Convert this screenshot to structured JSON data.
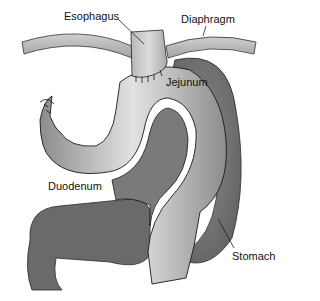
{
  "diagram": {
    "type": "anatomical-illustration",
    "labels": {
      "esophagus": "Esophagus",
      "diaphragm": "Diaphragm",
      "jejunum": "Jejunum",
      "duodenum": "Duodenum",
      "stomach": "Stomach"
    },
    "colors": {
      "background": "#ffffff",
      "stomach_dark": "#6e6e6e",
      "jejunum_mid": "#9a9a9a",
      "jejunum_highlight": "#e6e6e6",
      "diaphragm": "#b4b4b4",
      "outline": "#1a1a1a"
    }
  }
}
